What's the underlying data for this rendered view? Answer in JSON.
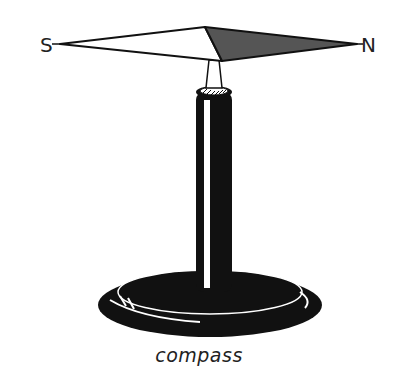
{
  "labels": {
    "south": "S",
    "north": "N"
  },
  "caption": "compass",
  "colors": {
    "ink": "#111111",
    "needle_north_fill": "#555555",
    "needle_south_fill": "#ffffff",
    "background": "#ffffff"
  }
}
